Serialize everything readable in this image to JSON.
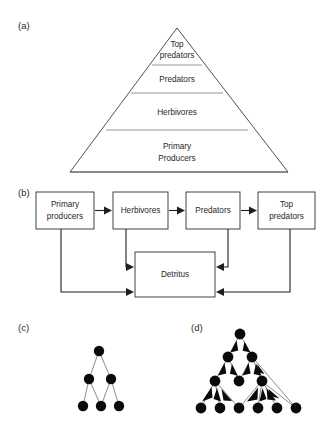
{
  "figure": {
    "background": "#ffffff",
    "ink": "#1a1a1a"
  },
  "panels": [
    {
      "id": "a",
      "label": "(a)",
      "x": 18,
      "y": 29,
      "type": "trophic-pyramid"
    },
    {
      "id": "b",
      "label": "(b)",
      "x": 18,
      "y": 196,
      "type": "energy-flow-diagram"
    },
    {
      "id": "c",
      "label": "(c)",
      "x": 18,
      "y": 331,
      "type": "simple-food-web"
    },
    {
      "id": "d",
      "label": "(d)",
      "x": 191,
      "y": 331,
      "type": "complex-food-web"
    }
  ],
  "pyramid": {
    "apex": {
      "x": 177,
      "y": 28
    },
    "base_left": {
      "x": 70,
      "y": 172
    },
    "base_right": {
      "x": 288,
      "y": 172
    },
    "divider_y": [
      65,
      93,
      130
    ],
    "outline_color": "#3c3c3c",
    "divider_color": "#8a8a8a",
    "tiers": [
      {
        "name": "top-predators",
        "lines": [
          "Top",
          "predators"
        ],
        "cx": 177,
        "cy": 47
      },
      {
        "name": "predators",
        "lines": [
          "Predators"
        ],
        "cx": 177,
        "cy": 82
      },
      {
        "name": "herbivores",
        "lines": [
          "Herbivores"
        ],
        "cx": 177,
        "cy": 114
      },
      {
        "name": "primary-producers",
        "lines": [
          "Primary",
          "Producers"
        ],
        "cx": 177,
        "cy": 148
      }
    ]
  },
  "flow": {
    "box_stroke": "#2e2e2e",
    "arrow_color": "#1f1f1f",
    "boxes": [
      {
        "name": "primary-producers",
        "lines": [
          "Primary",
          "producers"
        ],
        "x": 36,
        "y": 192,
        "w": 58,
        "h": 37
      },
      {
        "name": "herbivores",
        "lines": [
          "Herbivores"
        ],
        "x": 113,
        "y": 192,
        "w": 55,
        "h": 37
      },
      {
        "name": "predators",
        "lines": [
          "Predators"
        ],
        "x": 186,
        "y": 192,
        "w": 54,
        "h": 37
      },
      {
        "name": "top-predators",
        "lines": [
          "Top",
          "predators"
        ],
        "x": 258,
        "y": 192,
        "w": 57,
        "h": 37
      },
      {
        "name": "detritus",
        "lines": [
          "Detritus"
        ],
        "x": 135,
        "y": 252,
        "w": 80,
        "h": 45
      }
    ],
    "chain_arrows": [
      {
        "name": "producers-to-herbivores",
        "from": "primary-producers",
        "to": "herbivores"
      },
      {
        "name": "herbivores-to-predators",
        "from": "herbivores",
        "to": "predators"
      },
      {
        "name": "predators-to-top-predators",
        "from": "predators",
        "to": "top-predators"
      }
    ],
    "detritus_arrows": [
      {
        "name": "herbivores-to-detritus",
        "from": "herbivores",
        "to": "detritus"
      },
      {
        "name": "producers-to-detritus",
        "from": "primary-producers",
        "to": "detritus"
      },
      {
        "name": "predators-to-detritus",
        "from": "predators",
        "to": "detritus"
      },
      {
        "name": "top-predators-to-detritus",
        "from": "top-predators",
        "to": "detritus"
      }
    ]
  },
  "web_simple": {
    "node_color": "#0a0a0a",
    "edge_color": "#6e6e6e",
    "node_radius": 5.2,
    "nodes": [
      {
        "id": "s0",
        "x": 99,
        "y": 351,
        "row": 0
      },
      {
        "id": "s1",
        "x": 89,
        "y": 379,
        "row": 1
      },
      {
        "id": "s2",
        "x": 111,
        "y": 379,
        "row": 1
      },
      {
        "id": "s3",
        "x": 83,
        "y": 406,
        "row": 2
      },
      {
        "id": "s4",
        "x": 101,
        "y": 406,
        "row": 2
      },
      {
        "id": "s5",
        "x": 119,
        "y": 406,
        "row": 2
      }
    ],
    "edges": [
      {
        "from": "s1",
        "to": "s0"
      },
      {
        "from": "s2",
        "to": "s0"
      },
      {
        "from": "s3",
        "to": "s1"
      },
      {
        "from": "s4",
        "to": "s1"
      },
      {
        "from": "s4",
        "to": "s2"
      },
      {
        "from": "s5",
        "to": "s2"
      }
    ]
  },
  "web_complex": {
    "node_color": "#0a0a0a",
    "edge_color": "#6e6e6e",
    "node_radius": 5.2,
    "nodes": [
      {
        "id": "c0",
        "x": 240,
        "y": 334,
        "row": 0
      },
      {
        "id": "c1",
        "x": 228,
        "y": 357,
        "row": 1
      },
      {
        "id": "c2",
        "x": 252,
        "y": 357,
        "row": 1
      },
      {
        "id": "c3",
        "x": 215,
        "y": 381,
        "row": 2
      },
      {
        "id": "c4",
        "x": 239,
        "y": 381,
        "row": 2
      },
      {
        "id": "c5",
        "x": 262,
        "y": 381,
        "row": 2
      },
      {
        "id": "c6",
        "x": 201,
        "y": 408,
        "row": 3
      },
      {
        "id": "c7",
        "x": 220,
        "y": 408,
        "row": 3
      },
      {
        "id": "c8",
        "x": 239,
        "y": 408,
        "row": 3
      },
      {
        "id": "c9",
        "x": 258,
        "y": 408,
        "row": 3
      },
      {
        "id": "c10",
        "x": 277,
        "y": 408,
        "row": 3
      },
      {
        "id": "c11",
        "x": 296,
        "y": 408,
        "row": 3
      }
    ],
    "edges": [
      {
        "from": "c1",
        "to": "c0",
        "weight": "thick"
      },
      {
        "from": "c2",
        "to": "c0",
        "weight": "thin"
      },
      {
        "from": "c3",
        "to": "c1",
        "weight": "thick"
      },
      {
        "from": "c4",
        "to": "c1",
        "weight": "thin"
      },
      {
        "from": "c4",
        "to": "c2",
        "weight": "thin"
      },
      {
        "from": "c5",
        "to": "c2",
        "weight": "thick"
      },
      {
        "from": "c11",
        "to": "c2",
        "weight": "thin"
      },
      {
        "from": "c6",
        "to": "c3",
        "weight": "thick"
      },
      {
        "from": "c7",
        "to": "c3",
        "weight": "thin"
      },
      {
        "from": "c8",
        "to": "c3",
        "weight": "thin"
      },
      {
        "from": "c8",
        "to": "c5",
        "weight": "thick"
      },
      {
        "from": "c9",
        "to": "c5",
        "weight": "thin"
      },
      {
        "from": "c10",
        "to": "c5",
        "weight": "thin"
      },
      {
        "from": "c11",
        "to": "c5",
        "weight": "thin"
      }
    ]
  }
}
